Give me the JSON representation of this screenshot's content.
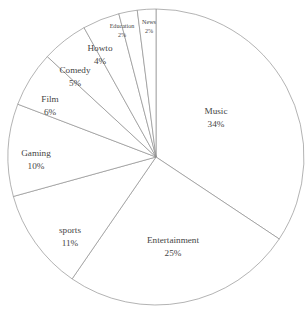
{
  "chart_data": {
    "type": "pie",
    "title": "",
    "subtitle": "",
    "xlabel": "",
    "ylabel": "",
    "grid": false,
    "legend": "none",
    "label_format": "name above percent",
    "start_angle_deg": 90,
    "direction": "clockwise",
    "total_percent": 99,
    "center": {
      "x": 156,
      "y": 157
    },
    "radius": 148,
    "colors": {
      "slice_fill": "#ffffff",
      "slice_stroke": "#8a8a8a",
      "label_text": "#454545",
      "background": "#ffffff"
    },
    "categories": [
      "Music",
      "Entertainment",
      "sports",
      "Gaming",
      "Film",
      "Comedy",
      "Howto",
      "Education",
      "News"
    ],
    "values": [
      34,
      25,
      11,
      10,
      6,
      5,
      4,
      2,
      2
    ],
    "slices": [
      {
        "label": "Music",
        "percent": 34,
        "percent_text": "34%",
        "label_x": 216,
        "label_y": 112,
        "name_font_size": 9.2,
        "pct_font_size": 9.2,
        "line_gap": 13
      },
      {
        "label": "Entertainment",
        "percent": 25,
        "percent_text": "25%",
        "label_x": 173,
        "label_y": 241,
        "name_font_size": 9.2,
        "pct_font_size": 9.2,
        "line_gap": 13
      },
      {
        "label": "sports",
        "percent": 11,
        "percent_text": "11%",
        "label_x": 70,
        "label_y": 231,
        "name_font_size": 9.2,
        "pct_font_size": 9.2,
        "line_gap": 13
      },
      {
        "label": "Gaming",
        "percent": 10,
        "percent_text": "10%",
        "label_x": 36,
        "label_y": 154,
        "name_font_size": 9.2,
        "pct_font_size": 9.2,
        "line_gap": 13
      },
      {
        "label": "Film",
        "percent": 6,
        "percent_text": "6%",
        "label_x": 50,
        "label_y": 100,
        "name_font_size": 9.2,
        "pct_font_size": 9.2,
        "line_gap": 13
      },
      {
        "label": "Comedy",
        "percent": 5,
        "percent_text": "5%",
        "label_x": 75,
        "label_y": 71,
        "name_font_size": 9.2,
        "pct_font_size": 9.2,
        "line_gap": 13
      },
      {
        "label": "Howto",
        "percent": 4,
        "percent_text": "4%",
        "label_x": 100,
        "label_y": 49,
        "name_font_size": 9.2,
        "pct_font_size": 9.2,
        "line_gap": 13
      },
      {
        "label": "Education",
        "percent": 2,
        "percent_text": "2%",
        "label_x": 122,
        "label_y": 27,
        "name_font_size": 6.1,
        "pct_font_size": 6.1,
        "line_gap": 9
      },
      {
        "label": "News",
        "percent": 2,
        "percent_text": "2%",
        "label_x": 149,
        "label_y": 23,
        "name_font_size": 6.1,
        "pct_font_size": 6.1,
        "line_gap": 9
      }
    ]
  }
}
